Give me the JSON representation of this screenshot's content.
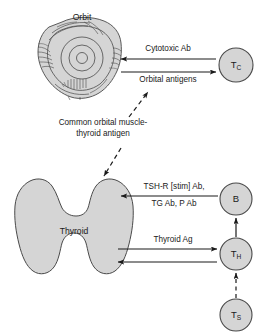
{
  "diagram": {
    "colors": {
      "fill": "#d5d5d5",
      "stroke": "#555555",
      "line": "#1a1a1a",
      "text": "#1a1a1a",
      "background": "#ffffff"
    }
  },
  "organs": {
    "orbit": {
      "label": "Orbit"
    },
    "thyroid": {
      "label": "Thyroid"
    }
  },
  "cells": {
    "tc": {
      "label": "T",
      "sub": "C"
    },
    "b": {
      "label": "B",
      "sub": ""
    },
    "th": {
      "label": "T",
      "sub": "H"
    },
    "ts": {
      "label": "T",
      "sub": "S"
    }
  },
  "arrows": {
    "cytotoxic_ab": {
      "label": "Cytotoxic Ab",
      "direction": "left"
    },
    "orbital_antigens": {
      "label": "Orbital antigens",
      "direction": "right"
    },
    "common_antigen": {
      "line1": "Common orbital muscle-",
      "line2": "thyroid antigen",
      "direction": "both",
      "style": "dashed"
    },
    "tshr_ab": {
      "line1": "TSH-R [stim] Ab,",
      "line2": "TG Ab, P Ab",
      "direction": "left"
    },
    "thyroid_ag_out": {
      "label": "Thyroid Ag",
      "direction": "right"
    },
    "thyroid_ag_in": {
      "label": "",
      "direction": "left"
    },
    "th_to_b": {
      "label": "",
      "direction": "up",
      "style": "solid"
    },
    "ts_to_th": {
      "label": "",
      "direction": "up",
      "style": "dashed"
    }
  }
}
